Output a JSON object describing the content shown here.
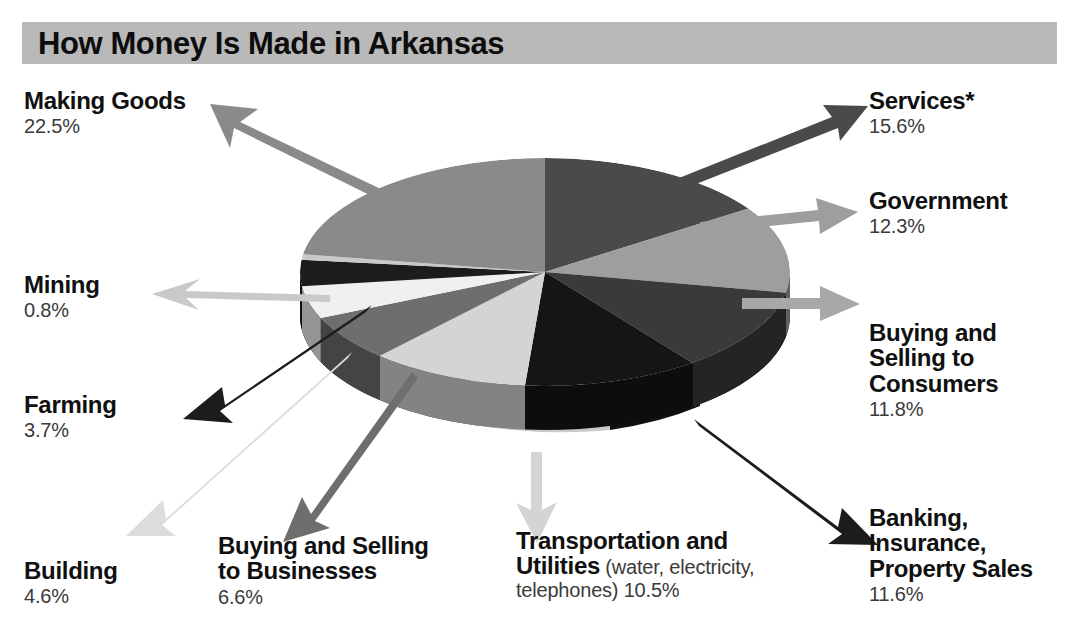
{
  "title": "How Money Is Made in Arkansas",
  "colors": {
    "banner_bg": "#b9b9b9",
    "title_text": "#0d0d0d",
    "label_text": "#101010",
    "pct_text": "#3a3a3a",
    "background": "#ffffff"
  },
  "chart_data": {
    "type": "pie",
    "title": "How Money Is Made in Arkansas",
    "unit": "percent",
    "three_d": true,
    "legend": "callout-labels-with-arrows",
    "categories": [
      "Services*",
      "Government",
      "Buying and Selling to Consumers",
      "Banking, Insurance, Property Sales",
      "Transportation and Utilities",
      "Buying and Selling to Businesses",
      "Building",
      "Farming",
      "Mining",
      "Making Goods"
    ],
    "values": [
      15.6,
      12.3,
      11.8,
      11.6,
      10.5,
      6.6,
      4.6,
      3.7,
      0.8,
      22.5
    ],
    "slice_colors": [
      "#4a4a4a",
      "#9e9e9e",
      "#3a3a3a",
      "#151515",
      "#d4d4d4",
      "#6e6e6e",
      "#f0f0f0",
      "#1c1c1c",
      "#c9c9c9",
      "#8a8a8a"
    ],
    "total": 100.0
  },
  "labels": [
    {
      "id": "making-goods",
      "name": "Making Goods",
      "pct": "22.5%",
      "arrow_color": "#8a8a8a"
    },
    {
      "id": "services",
      "name": "Services*",
      "pct": "15.6%",
      "arrow_color": "#4a4a4a"
    },
    {
      "id": "government",
      "name": "Government",
      "pct": "12.3%",
      "arrow_color": "#9e9e9e"
    },
    {
      "id": "buying-selling-consumers",
      "name_line1": "Buying and",
      "name_line2": "Selling to",
      "name_line3": "Consumers",
      "pct": "11.8%",
      "arrow_color": "#a8a8a8"
    },
    {
      "id": "banking",
      "name_line1": "Banking,",
      "name_line2": "Insurance,",
      "name_line3": "Property Sales",
      "pct": "11.6%",
      "arrow_color": "#1c1c1c"
    },
    {
      "id": "transportation",
      "name_line1": "Transportation and",
      "name_line2": "Utilities",
      "note_line1": " (water, electricity,",
      "note_line2": "telephones) 10.5%",
      "arrow_color": "#d4d4d4"
    },
    {
      "id": "buying-selling-businesses",
      "name_line1": "Buying and Selling",
      "name_line2": "to Businesses",
      "pct": "6.6%",
      "arrow_color": "#6e6e6e"
    },
    {
      "id": "building",
      "name": "Building",
      "pct": "4.6%",
      "arrow_color": "#dcdcdc"
    },
    {
      "id": "farming",
      "name": "Farming",
      "pct": "3.7%",
      "arrow_color": "#1c1c1c"
    },
    {
      "id": "mining",
      "name": "Mining",
      "pct": "0.8%",
      "arrow_color": "#c9c9c9"
    }
  ]
}
